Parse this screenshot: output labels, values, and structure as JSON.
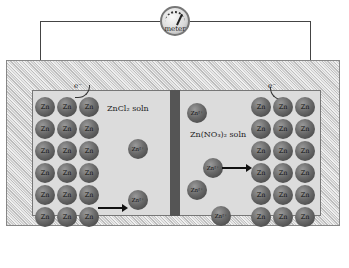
{
  "meter": {
    "label": "meter",
    "icon": "gauge-icon"
  },
  "electrons": {
    "left": "e⁻",
    "right": "e⁻"
  },
  "solutions": {
    "left": "ZnCl₂ soln",
    "right": "Zn(NO₃)₂ soln"
  },
  "atom_label": "Zn",
  "ion_label": "Zn²⁺",
  "left_electrode": {
    "rows": 6,
    "cols": 3
  },
  "right_electrode": {
    "rows": 6,
    "cols": 3
  },
  "left_ions": [
    {
      "x": 128,
      "y": 139
    },
    {
      "x": 128,
      "y": 190
    }
  ],
  "right_ions": [
    {
      "x": 187,
      "y": 103
    },
    {
      "x": 203,
      "y": 158
    },
    {
      "x": 187,
      "y": 180
    },
    {
      "x": 211,
      "y": 206
    }
  ],
  "colors": {
    "solution": "#dcdcdc",
    "divider": "#555555",
    "atom": "#6a6a6a"
  }
}
